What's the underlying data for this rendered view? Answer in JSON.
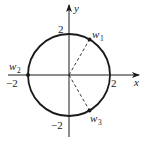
{
  "figure": {
    "axes": {
      "x_label": "x",
      "y_label": "y"
    },
    "ticks": {
      "x_pos": "2",
      "x_neg": "−2",
      "y_pos": "2",
      "y_neg": "−2"
    },
    "circle": {
      "center": [
        0,
        0
      ],
      "radius": 2
    },
    "points": [
      {
        "name": "w",
        "sub": "1",
        "angle_deg": 60
      },
      {
        "name": "w",
        "sub": "2",
        "angle_deg": 180
      },
      {
        "name": "w",
        "sub": "3",
        "angle_deg": -60
      }
    ],
    "colors": {
      "stroke": "#1a1a1a",
      "background": "#ffffff"
    }
  }
}
